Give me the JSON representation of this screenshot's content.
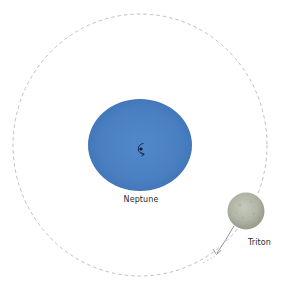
{
  "diagram": {
    "colors": {
      "background": "#ffffff",
      "orbit": "#b5b5b5",
      "neptune_fill": "#4a7fc1",
      "neptune_edge": "#3e70b2",
      "triton_fill": "#b3b8a8",
      "triton_edge": "#8f9484",
      "arrow": "#9a9a9a",
      "rotation_symbol": "#14233f"
    },
    "neptune": {
      "label": "Neptune",
      "symbol": "rotation-arrow-icon"
    },
    "triton": {
      "label": "Triton"
    },
    "orbit": {
      "style": "dashed",
      "direction": "clockwise"
    }
  }
}
